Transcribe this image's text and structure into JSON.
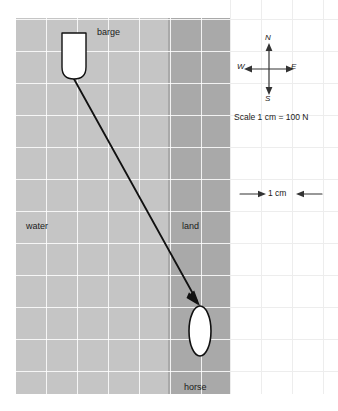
{
  "figure": {
    "regions": {
      "water": {
        "label": "water",
        "color": "#c5c5c5"
      },
      "land": {
        "label": "land",
        "color": "#a9a9a9"
      },
      "paper": {
        "color": "#ffffff",
        "grid_color": "#ededed"
      }
    },
    "objects": {
      "barge": {
        "label": "barge",
        "fill": "#ffffff",
        "stroke": "#000000"
      },
      "horse": {
        "label": "horse",
        "fill": "#ffffff",
        "stroke": "#000000"
      }
    },
    "force_vector": {
      "label": "",
      "color": "#000000",
      "start": {
        "x": 74,
        "y": 79
      },
      "end": {
        "x": 200,
        "y": 306
      }
    },
    "compass": {
      "north": "N",
      "south": "S",
      "west": "W",
      "east": "E"
    },
    "scale": {
      "text": "Scale 1 cm = 100 N",
      "ruler_label": "1 cm"
    },
    "grid": {
      "cell_width": 31,
      "cell_height": 32
    }
  }
}
